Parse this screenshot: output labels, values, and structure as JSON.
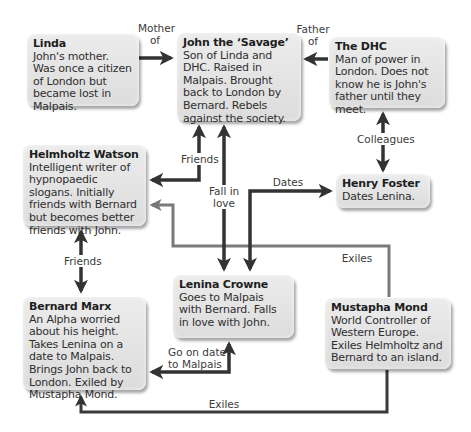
{
  "diagram": {
    "type": "character-relationship-map",
    "colors": {
      "arrow_dark": "#333333",
      "arrow_grey": "#777777",
      "box_fill": "#e2e2e2",
      "text": "#2a2a2a"
    },
    "nodes": [
      {
        "id": "linda",
        "name": "Linda",
        "desc": "John's mother. Was once a citizen of London but became lost in Malpais."
      },
      {
        "id": "john",
        "name": "John the ‘Savage’",
        "desc": "Son of Linda and DHC. Raised in Malpais. Brought back to London by Bernard. Rebels against the society."
      },
      {
        "id": "dhc",
        "name": "The DHC",
        "desc": "Man of power in London. Does not know he is John's father until they meet."
      },
      {
        "id": "helmholtz",
        "name": "Helmholtz Watson",
        "desc": "Intelligent writer of hypnopaedic slogans. Initially friends with Bernard but becomes better friends with John."
      },
      {
        "id": "henry",
        "name": "Henry Foster",
        "desc": "Dates Lenina."
      },
      {
        "id": "lenina",
        "name": "Lenina Crowne",
        "desc": "Goes to Malpais with Bernard. Falls in love with John."
      },
      {
        "id": "bernard",
        "name": "Bernard Marx",
        "desc": "An Alpha worried about his height. Takes Lenina on a date to Malpais. Brings John back to London. Exiled by Mustapha Mond."
      },
      {
        "id": "mustapha",
        "name": "Mustapha Mond",
        "desc": "World Controller of Western Europe. Exiles Helmholtz and Bernard to an island."
      }
    ],
    "edges": [
      {
        "from": "linda",
        "to": "john",
        "label": "Mother of",
        "style": "dark"
      },
      {
        "from": "dhc",
        "to": "john",
        "label": "Father of",
        "style": "dark"
      },
      {
        "from": "dhc",
        "to": "henry",
        "label": "Colleagues",
        "style": "dark",
        "bidirectional": true
      },
      {
        "from": "john",
        "to": "helmholtz",
        "label": "Friends",
        "style": "dark",
        "bidirectional": true
      },
      {
        "from": "john",
        "to": "lenina",
        "label": "Fall in love",
        "style": "dark",
        "bidirectional": true
      },
      {
        "from": "lenina",
        "to": "henry",
        "label": "Dates",
        "style": "dark",
        "bidirectional": true
      },
      {
        "from": "helmholtz",
        "to": "bernard",
        "label": "Friends",
        "style": "dark",
        "bidirectional": true
      },
      {
        "from": "bernard",
        "to": "lenina",
        "label": "Go on date to Malpais",
        "style": "dark",
        "bidirectional": true
      },
      {
        "from": "mustapha",
        "to": "helmholtz",
        "label": "Exiles",
        "style": "grey"
      },
      {
        "from": "mustapha",
        "to": "bernard",
        "label": "Exiles",
        "style": "dark"
      }
    ],
    "labels": {
      "mother_of_line1": "Mother",
      "mother_of_line2": "of",
      "father_of_line1": "Father",
      "father_of_line2": "of",
      "colleagues": "Colleagues",
      "friends_john_helmholtz": "Friends",
      "fall_in_love_line1": "Fall in",
      "fall_in_love_line2": "love",
      "dates": "Dates",
      "friends_helmholtz_bernard": "Friends",
      "go_on_date_line1": "Go on date",
      "go_on_date_line2": "to Malpais",
      "exiles_helmholtz": "Exiles",
      "exiles_bernard": "Exiles"
    }
  }
}
